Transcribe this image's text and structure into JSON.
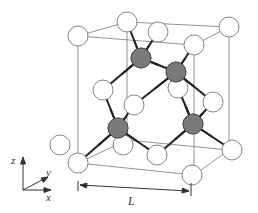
{
  "diagram": {
    "type": "crystal-unit-cell",
    "colors": {
      "white_atom_fill": "#ffffff",
      "gray_atom_fill": "#7a7a7a",
      "bond": "#222222",
      "edge": "#777777"
    },
    "axes": {
      "z_label": "z",
      "y_label": "y",
      "x_label": "x"
    },
    "dimension": {
      "label": "L"
    },
    "white_atoms": [
      [
        78,
        163
      ],
      [
        78,
        36
      ],
      [
        127,
        22
      ],
      [
        229,
        27
      ],
      [
        194,
        45
      ],
      [
        158,
        32
      ],
      [
        103,
        90
      ],
      [
        134,
        105
      ],
      [
        178,
        88
      ],
      [
        213,
        102
      ],
      [
        123,
        145
      ],
      [
        157,
        155
      ],
      [
        192,
        175
      ],
      [
        232,
        150
      ],
      [
        60,
        145
      ]
    ],
    "gray_atoms": [
      [
        141,
        58
      ],
      [
        176,
        72
      ],
      [
        118,
        128
      ],
      [
        193,
        124
      ]
    ],
    "bonds": [
      [
        141,
        58,
        127,
        22
      ],
      [
        141,
        58,
        158,
        32
      ],
      [
        141,
        58,
        103,
        90
      ],
      [
        141,
        58,
        176,
        72
      ],
      [
        176,
        72,
        194,
        45
      ],
      [
        176,
        72,
        134,
        105
      ],
      [
        176,
        72,
        213,
        102
      ],
      [
        176,
        72,
        178,
        88
      ],
      [
        118,
        128,
        78,
        163
      ],
      [
        118,
        128,
        103,
        90
      ],
      [
        118,
        128,
        134,
        105
      ],
      [
        118,
        128,
        157,
        155
      ],
      [
        193,
        124,
        178,
        88
      ],
      [
        193,
        124,
        213,
        102
      ],
      [
        193,
        124,
        157,
        155
      ],
      [
        193,
        124,
        232,
        150
      ],
      [
        118,
        128,
        123,
        145
      ]
    ],
    "edges": [
      [
        78,
        36,
        194,
        45
      ],
      [
        78,
        36,
        127,
        22
      ],
      [
        127,
        22,
        229,
        27
      ],
      [
        194,
        45,
        229,
        27
      ],
      [
        78,
        36,
        78,
        163
      ],
      [
        194,
        45,
        194,
        175
      ],
      [
        229,
        27,
        229,
        150
      ],
      [
        127,
        22,
        127,
        140
      ],
      [
        78,
        163,
        194,
        175
      ],
      [
        194,
        175,
        229,
        150
      ],
      [
        78,
        163,
        127,
        140
      ],
      [
        127,
        140,
        229,
        150
      ]
    ]
  }
}
